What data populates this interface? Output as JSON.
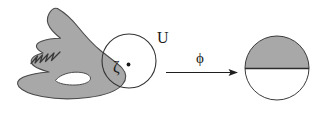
{
  "figure": {
    "kind": "mathematical-diagram",
    "caption_labels": {
      "neighborhood_label": "U",
      "point_label": "ζ",
      "map_label": "ϕ"
    },
    "colors": {
      "fill_gray": "#a8a8a8",
      "stroke_dark": "#4d4d4d",
      "outline_black": "#2b2b2b",
      "background": "#ffffff",
      "text": "#1a1a1a"
    },
    "left_region": {
      "name": "domain-blob",
      "description": "shaded planar domain with a jagged boundary notch and an interior hole",
      "has_hole": true,
      "has_zigzag_boundary": true
    },
    "neighborhood_circle": {
      "name": "neighborhood-U",
      "center_x": 129,
      "center_y": 61,
      "radius": 27,
      "label": "U",
      "label_x": 157,
      "label_y": 42
    },
    "marked_point": {
      "name": "boundary-point-zeta",
      "x": 128,
      "y": 65,
      "label": "ζ",
      "label_x": 114,
      "label_y": 71
    },
    "arrow": {
      "name": "map-arrow",
      "label": "ϕ",
      "x_start": 166,
      "x_end": 238,
      "y": 72,
      "label_x": 201,
      "label_y": 62
    },
    "right_region": {
      "name": "image-half-disk",
      "description": "disk with upper half shaded and a horizontal diameter",
      "center_x": 277,
      "center_y": 68,
      "radius": 32,
      "shaded_half": "upper"
    }
  }
}
